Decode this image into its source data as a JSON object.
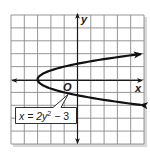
{
  "chart_data": {
    "type": "line",
    "title": "",
    "xlabel": "x",
    "ylabel": "y",
    "origin_label": "O",
    "xlim": [
      -5,
      5
    ],
    "ylim": [
      -5,
      5
    ],
    "grid": true,
    "grid_step": 1,
    "tick_labels": [],
    "series": [
      {
        "name": "x = 2y^2 - 3",
        "equation": "x = 2y² − 3",
        "orientation": "horizontal parabola opening right",
        "vertex": [
          -3,
          0
        ],
        "points": [
          {
            "x": 5,
            "y": -2
          },
          {
            "x": 1.5,
            "y": -1.5
          },
          {
            "x": -1,
            "y": -1
          },
          {
            "x": -2.5,
            "y": -0.5
          },
          {
            "x": -3,
            "y": 0
          },
          {
            "x": -2.5,
            "y": 0.5
          },
          {
            "x": -1,
            "y": 1
          },
          {
            "x": 1.5,
            "y": 1.5
          },
          {
            "x": 5,
            "y": 2
          }
        ],
        "arrows_at_ends": true
      }
    ],
    "annotations": [
      {
        "text": "x = 2y² − 3",
        "type": "callout-box",
        "points_to": [
          -0.5,
          -1.1
        ]
      }
    ]
  },
  "labels": {
    "x_axis": "x",
    "y_axis": "y",
    "origin": "O",
    "equation_lhs": "x = 2y",
    "equation_exp": "2",
    "equation_rhs": " − 3"
  },
  "colors": {
    "grid": "#8a8a8a",
    "axis": "#1a1a1a",
    "curve": "#111111",
    "background": "#ffffff"
  }
}
